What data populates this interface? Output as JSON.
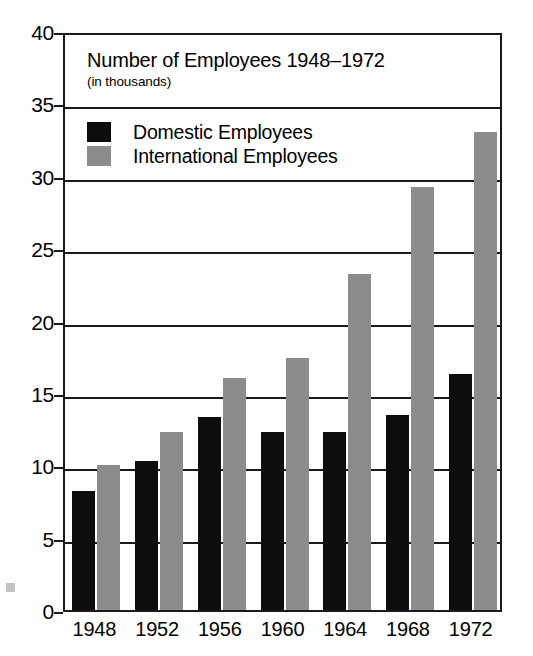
{
  "chart_data": {
    "type": "bar",
    "title": "Number of Employees 1948–1972",
    "subtitle": "(in thousands)",
    "xlabel": "",
    "ylabel": "",
    "categories": [
      "1948",
      "1952",
      "1956",
      "1960",
      "1964",
      "1968",
      "1972"
    ],
    "series": [
      {
        "name": "Domestic Employees",
        "color": "#0d0d0d",
        "values": [
          8.2,
          10.3,
          13.3,
          12.3,
          12.3,
          13.5,
          16.3
        ]
      },
      {
        "name": "International Employees",
        "color": "#8c8c8c",
        "values": [
          10.0,
          12.3,
          16.0,
          17.4,
          23.2,
          29.2,
          33.0
        ]
      }
    ],
    "ylim": [
      0,
      40
    ],
    "ytick_step": 5,
    "yticks": [
      "40",
      "35",
      "30",
      "25",
      "20",
      "15",
      "10",
      "5",
      "0"
    ],
    "grid": "horizontal",
    "legend_position": "top-left-inside",
    "frame": "box"
  },
  "axis": {
    "y_tick_labels": [
      "40",
      "35",
      "30",
      "25",
      "20",
      "15",
      "10",
      "5",
      "0"
    ],
    "x_tick_labels": [
      "1948",
      "1952",
      "1956",
      "1960",
      "1964",
      "1968",
      "1972"
    ]
  },
  "legend": {
    "items": [
      {
        "label": "Domestic Employees",
        "swatch": "black-square-swatch"
      },
      {
        "label": "International Employees",
        "swatch": "gray-square-swatch"
      }
    ]
  }
}
